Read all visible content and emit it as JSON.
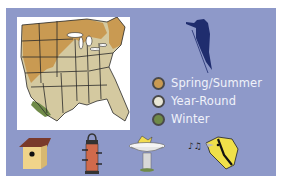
{
  "colors": {
    "panel_background": "#8e99c9",
    "map_background": "#ffffff",
    "legend_text": "#f0f2fa",
    "woodpecker": "#1f2d6e"
  },
  "map": {
    "region": "United States (eastern and central)",
    "ranges": [
      {
        "season": "Spring/Summer",
        "color": "#c99a52"
      },
      {
        "season": "Year-Round",
        "color": "#d4c9a0"
      },
      {
        "season": "Winter",
        "color": "#6f8a48"
      }
    ]
  },
  "legend": {
    "items": [
      {
        "label": "Spring/Summer",
        "color": "#c99a52"
      },
      {
        "label": "Year-Round",
        "color": "#e8e6d6"
      },
      {
        "label": "Winter",
        "color": "#6f8a48"
      }
    ]
  },
  "icons": {
    "bird_silhouette": "woodpecker-icon",
    "bottom_row": [
      "birdhouse-icon",
      "tube-feeder-icon",
      "birdbath-icon",
      "singing-bird-icon"
    ]
  }
}
